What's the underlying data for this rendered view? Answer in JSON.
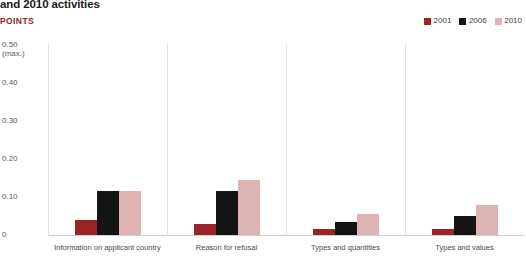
{
  "header": {
    "title": "and 2010 activities",
    "unit_label": "POINTS"
  },
  "legend": {
    "items": [
      {
        "label": "2001",
        "color": "#9b2226"
      },
      {
        "label": "2006",
        "color": "#141414"
      },
      {
        "label": "2010",
        "color": "#ddb3b3"
      }
    ]
  },
  "yaxis": {
    "ticks": [
      {
        "label": "0.50",
        "sub": "(max.)",
        "value": 0.5
      },
      {
        "label": "0.40",
        "sub": "",
        "value": 0.4
      },
      {
        "label": "0.30",
        "sub": "",
        "value": 0.3
      },
      {
        "label": "0.20",
        "sub": "",
        "value": 0.2
      },
      {
        "label": "0.10",
        "sub": "",
        "value": 0.1
      },
      {
        "label": "0",
        "sub": "",
        "value": 0
      }
    ]
  },
  "chart_data": {
    "type": "bar",
    "title": "and 2010 activities",
    "xlabel": "",
    "ylabel": "POINTS",
    "ylim": [
      0,
      0.5
    ],
    "grid": false,
    "legend_position": "top-right",
    "categories": [
      "Information on applicant country",
      "Reason for refusal",
      "Types and quantities",
      "Types and values"
    ],
    "series": [
      {
        "name": "2001",
        "color": "#9b2226",
        "values": [
          0.04,
          0.03,
          0.015,
          0.015
        ]
      },
      {
        "name": "2006",
        "color": "#141414",
        "values": [
          0.115,
          0.115,
          0.035,
          0.05
        ]
      },
      {
        "name": "2010",
        "color": "#ddb3b3",
        "values": [
          0.115,
          0.145,
          0.055,
          0.08
        ]
      }
    ]
  }
}
